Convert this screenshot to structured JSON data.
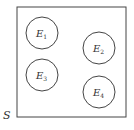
{
  "diagram": {
    "type": "venn",
    "sample_space": {
      "label": "S",
      "x": 17,
      "y": 7,
      "width": 109,
      "height": 110
    },
    "sets": [
      {
        "label": "E",
        "sub": "1",
        "cx": 42,
        "cy": 33,
        "r": 16
      },
      {
        "label": "E",
        "sub": "2",
        "cx": 99,
        "cy": 48,
        "r": 16
      },
      {
        "label": "E",
        "sub": "3",
        "cx": 42,
        "cy": 75,
        "r": 16
      },
      {
        "label": "E",
        "sub": "4",
        "cx": 99,
        "cy": 92,
        "r": 16
      }
    ],
    "colors": {
      "stroke": "#444444",
      "text": "#333333"
    }
  }
}
